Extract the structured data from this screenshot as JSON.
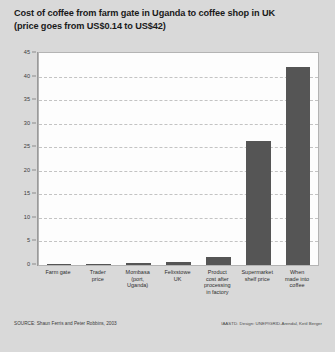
{
  "title": {
    "line1": "Cost of coffee from farm gate in Uganda to coffee shop in UK",
    "line2": "(price goes from US$0.14 to US$42)"
  },
  "footer": {
    "source": "SOURCE: Shaun Ferris and Peter Robbins, 2003",
    "credit": "IAASTD. Design: UNEP/GRID-Arendal, Ketil Berger"
  },
  "colors": {
    "bar": "#555555",
    "page_background": "#d9d9d9",
    "plot_background": "#fdfdfd",
    "gridline": "#c3c3c3"
  },
  "chart_data": {
    "type": "bar",
    "title": "Cost of coffee from farm gate in Uganda to coffee shop in UK (price goes from US$0.14 to US$42)",
    "xlabel": "",
    "ylabel": "",
    "categories": [
      "Farm gate",
      "Trader price",
      "Mombasa (port, Uganda)",
      "Felixstowe UK",
      "Product cost after processing in factory",
      "Supermarket shelf price",
      "When made into coffee"
    ],
    "category_lines": [
      [
        "Farm gate"
      ],
      [
        "Trader",
        "price"
      ],
      [
        "Mombasa",
        "(port,",
        "Uganda)"
      ],
      [
        "Felixstowe",
        "UK"
      ],
      [
        "Product",
        "cost after",
        "processing",
        "in factory"
      ],
      [
        "Supermarket",
        "shelf price"
      ],
      [
        "When",
        "made into",
        "coffee"
      ]
    ],
    "values": [
      0.14,
      0.26,
      0.45,
      0.65,
      1.6,
      26.4,
      42.0
    ],
    "ylim": [
      0,
      45
    ],
    "yticks": [
      0,
      5,
      10,
      15,
      20,
      25,
      30,
      35,
      40,
      45
    ],
    "ytick_labels": [
      "0",
      "5",
      "10",
      "15",
      "20",
      "25",
      "30",
      "35",
      "40",
      "45"
    ],
    "grid": true,
    "grid_axis": "y",
    "legend": false,
    "units": "US$"
  }
}
